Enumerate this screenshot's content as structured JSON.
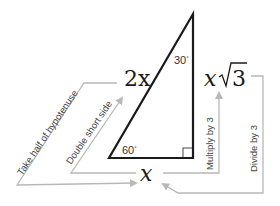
{
  "diagram": {
    "colors": {
      "triangle": "#1a1a1a",
      "arrows": "#b8b8b8",
      "text": "#444444"
    },
    "sides": {
      "hypotenuse": "2x",
      "short_leg": "x",
      "long_leg_var": "x",
      "long_leg_radical": "3"
    },
    "angles": {
      "top": "30",
      "bottom_left": "60",
      "degree": "°"
    },
    "arrows": [
      {
        "id": "hyp-to-short",
        "label": "Take half of hypotenuse",
        "from": "2x",
        "to": "x"
      },
      {
        "id": "short-to-hyp",
        "label": "Double short side",
        "from": "x",
        "to": "2x"
      },
      {
        "id": "short-to-long",
        "label_prefix": "Multiply by ",
        "radical": "3",
        "from": "x",
        "to": "x√3"
      },
      {
        "id": "long-to-short",
        "label_prefix": "Divide by ",
        "radical": "3",
        "from": "x√3",
        "to": "x"
      }
    ]
  }
}
